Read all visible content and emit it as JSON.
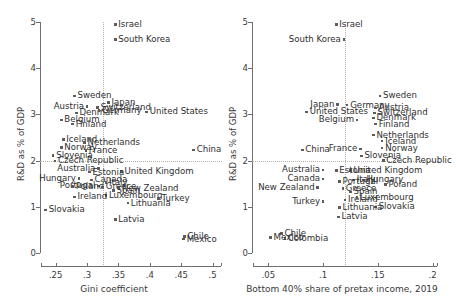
{
  "figure": {
    "type": "two-panel-scatter",
    "panels": 2,
    "marker_color": "#5d5d5d",
    "axis_color": "#6f6f6f",
    "refline_color": "#b9b0a8"
  },
  "chart_data": [
    {
      "type": "scatter",
      "panel": "left",
      "title": "",
      "xlabel": "Gini coefficient",
      "ylabel": "R&D as % of GDP",
      "xlim": [
        0.225,
        0.515
      ],
      "ylim": [
        0,
        5
      ],
      "xticks": [
        ".25",
        ".3",
        ".35",
        ".4",
        ".45",
        ".5"
      ],
      "xtick_values": [
        0.25,
        0.3,
        0.35,
        0.4,
        0.45,
        0.5
      ],
      "yticks": [
        "0",
        "1",
        "2",
        "3",
        "4",
        "5"
      ],
      "ytick_values": [
        0,
        1,
        2,
        3,
        4,
        5
      ],
      "grid": false,
      "legend": "none",
      "reference_lines": {
        "vertical_x": 0.325,
        "horizontal_y": 2.0,
        "style": "dotted"
      },
      "points": [
        {
          "label": "Israel",
          "x": 0.345,
          "y": 4.95,
          "lpos": "right"
        },
        {
          "label": "South Korea",
          "x": 0.345,
          "y": 4.62,
          "lpos": "right"
        },
        {
          "label": "Sweden",
          "x": 0.28,
          "y": 3.4,
          "lpos": "right"
        },
        {
          "label": "Japan",
          "x": 0.334,
          "y": 3.26,
          "lpos": "right"
        },
        {
          "label": "Austria",
          "x": 0.3,
          "y": 3.17,
          "lpos": "left"
        },
        {
          "label": "Switzerland",
          "x": 0.317,
          "y": 3.15,
          "lpos": "right"
        },
        {
          "label": "Denmark",
          "x": 0.283,
          "y": 3.03,
          "lpos": "right"
        },
        {
          "label": "Germany",
          "x": 0.319,
          "y": 3.08,
          "lpos": "right"
        },
        {
          "label": "United States",
          "x": 0.395,
          "y": 3.05,
          "lpos": "right"
        },
        {
          "label": "Belgium",
          "x": 0.259,
          "y": 2.88,
          "lpos": "right"
        },
        {
          "label": "Finland",
          "x": 0.277,
          "y": 2.79,
          "lpos": "right"
        },
        {
          "label": "Iceland",
          "x": 0.262,
          "y": 2.46,
          "lpos": "right"
        },
        {
          "label": "Netherlands",
          "x": 0.296,
          "y": 2.39,
          "lpos": "right"
        },
        {
          "label": "Norway",
          "x": 0.259,
          "y": 2.28,
          "lpos": "right"
        },
        {
          "label": "France",
          "x": 0.298,
          "y": 2.22,
          "lpos": "right"
        },
        {
          "label": "China",
          "x": 0.47,
          "y": 2.23,
          "lpos": "right"
        },
        {
          "label": "Slovenia",
          "x": 0.246,
          "y": 2.11,
          "lpos": "right"
        },
        {
          "label": "Czech Republic",
          "x": 0.249,
          "y": 1.99,
          "lpos": "right"
        },
        {
          "label": "Australia",
          "x": 0.318,
          "y": 1.83,
          "lpos": "left"
        },
        {
          "label": "United Kingdom",
          "x": 0.355,
          "y": 1.76,
          "lpos": "right"
        },
        {
          "label": "Estonia",
          "x": 0.304,
          "y": 1.75,
          "lpos": "right"
        },
        {
          "label": "Hungary",
          "x": 0.287,
          "y": 1.61,
          "lpos": "left"
        },
        {
          "label": "Canada",
          "x": 0.307,
          "y": 1.58,
          "lpos": "right"
        },
        {
          "label": "Italy",
          "x": 0.33,
          "y": 1.53,
          "lpos": "right"
        },
        {
          "label": "Portugal",
          "x": 0.318,
          "y": 1.45,
          "lpos": "left"
        },
        {
          "label": "Poland",
          "x": 0.277,
          "y": 1.44,
          "lpos": "right"
        },
        {
          "label": "Greece",
          "x": 0.325,
          "y": 1.43,
          "lpos": "right"
        },
        {
          "label": "New Zealand",
          "x": 0.351,
          "y": 1.4,
          "lpos": "right"
        },
        {
          "label": "Spain",
          "x": 0.342,
          "y": 1.35,
          "lpos": "right"
        },
        {
          "label": "Luxembourg",
          "x": 0.33,
          "y": 1.25,
          "lpos": "right"
        },
        {
          "label": "Ireland",
          "x": 0.28,
          "y": 1.21,
          "lpos": "right"
        },
        {
          "label": "Turkey",
          "x": 0.414,
          "y": 1.18,
          "lpos": "right"
        },
        {
          "label": "Lithuania",
          "x": 0.365,
          "y": 1.08,
          "lpos": "right"
        },
        {
          "label": "Slovakia",
          "x": 0.234,
          "y": 0.93,
          "lpos": "right"
        },
        {
          "label": "Latvia",
          "x": 0.345,
          "y": 0.73,
          "lpos": "right"
        },
        {
          "label": "Chile",
          "x": 0.455,
          "y": 0.36,
          "lpos": "right"
        },
        {
          "label": "Mexico",
          "x": 0.454,
          "y": 0.3,
          "lpos": "right"
        }
      ]
    },
    {
      "type": "scatter",
      "panel": "right",
      "title": "",
      "xlabel": "Bottom 40% share of pretax income, 2019",
      "ylabel": "R&D as % of GDP",
      "xlim": [
        0.035,
        0.205
      ],
      "ylim": [
        0,
        5
      ],
      "xticks": [
        ".05",
        ".1",
        ".15",
        ".2"
      ],
      "xtick_values": [
        0.05,
        0.1,
        0.15,
        0.2
      ],
      "yticks": [
        "0",
        "1",
        "2",
        "3",
        "4",
        "5"
      ],
      "ytick_values": [
        0,
        1,
        2,
        3,
        4,
        5
      ],
      "grid": false,
      "legend": "none",
      "reference_lines": {
        "vertical_x": 0.12,
        "horizontal_y": 2.0,
        "style": "dotted"
      },
      "points": [
        {
          "label": "Israel",
          "x": 0.112,
          "y": 4.95,
          "lpos": "right"
        },
        {
          "label": "South Korea",
          "x": 0.119,
          "y": 4.62,
          "lpos": "left"
        },
        {
          "label": "Sweden",
          "x": 0.152,
          "y": 3.4,
          "lpos": "right"
        },
        {
          "label": "Japan",
          "x": 0.113,
          "y": 3.22,
          "lpos": "left"
        },
        {
          "label": "Germany",
          "x": 0.122,
          "y": 3.2,
          "lpos": "right"
        },
        {
          "label": "Austria",
          "x": 0.148,
          "y": 3.14,
          "lpos": "right"
        },
        {
          "label": "United States",
          "x": 0.085,
          "y": 3.05,
          "lpos": "right"
        },
        {
          "label": "Switzerland",
          "x": 0.147,
          "y": 3.03,
          "lpos": "right"
        },
        {
          "label": "Denmark",
          "x": 0.146,
          "y": 2.92,
          "lpos": "right"
        },
        {
          "label": "Belgium",
          "x": 0.131,
          "y": 2.88,
          "lpos": "left"
        },
        {
          "label": "Finland",
          "x": 0.148,
          "y": 2.79,
          "lpos": "right"
        },
        {
          "label": "Netherlands",
          "x": 0.146,
          "y": 2.55,
          "lpos": "right"
        },
        {
          "label": "Iceland",
          "x": 0.154,
          "y": 2.42,
          "lpos": "right"
        },
        {
          "label": "France",
          "x": 0.134,
          "y": 2.25,
          "lpos": "left"
        },
        {
          "label": "Norway",
          "x": 0.154,
          "y": 2.27,
          "lpos": "right"
        },
        {
          "label": "China",
          "x": 0.081,
          "y": 2.23,
          "lpos": "right"
        },
        {
          "label": "Slovenia",
          "x": 0.135,
          "y": 2.1,
          "lpos": "right"
        },
        {
          "label": "Czech Republic",
          "x": 0.155,
          "y": 2.0,
          "lpos": "right"
        },
        {
          "label": "United Kingdom",
          "x": 0.125,
          "y": 1.78,
          "lpos": "right"
        },
        {
          "label": "Australia",
          "x": 0.1,
          "y": 1.8,
          "lpos": "left"
        },
        {
          "label": "Estonia",
          "x": 0.112,
          "y": 1.78,
          "lpos": "right"
        },
        {
          "label": "Italy",
          "x": 0.128,
          "y": 1.58,
          "lpos": "right"
        },
        {
          "label": "Hungary",
          "x": 0.137,
          "y": 1.58,
          "lpos": "right"
        },
        {
          "label": "Canada",
          "x": 0.1,
          "y": 1.6,
          "lpos": "left"
        },
        {
          "label": "Portugal",
          "x": 0.115,
          "y": 1.55,
          "lpos": "right"
        },
        {
          "label": "Poland",
          "x": 0.157,
          "y": 1.48,
          "lpos": "right"
        },
        {
          "label": "New Zealand",
          "x": 0.095,
          "y": 1.42,
          "lpos": "left"
        },
        {
          "label": "Greece",
          "x": 0.118,
          "y": 1.4,
          "lpos": "right"
        },
        {
          "label": "Spain",
          "x": 0.125,
          "y": 1.32,
          "lpos": "right"
        },
        {
          "label": "Ireland",
          "x": 0.12,
          "y": 1.15,
          "lpos": "right"
        },
        {
          "label": "Luxembourg",
          "x": 0.131,
          "y": 1.2,
          "lpos": "right"
        },
        {
          "label": "Turkey",
          "x": 0.1,
          "y": 1.12,
          "lpos": "left"
        },
        {
          "label": "Slovakia",
          "x": 0.148,
          "y": 1.0,
          "lpos": "right"
        },
        {
          "label": "Lithuania",
          "x": 0.115,
          "y": 0.98,
          "lpos": "right"
        },
        {
          "label": "Latvia",
          "x": 0.114,
          "y": 0.78,
          "lpos": "right"
        },
        {
          "label": "Chile",
          "x": 0.062,
          "y": 0.42,
          "lpos": "right"
        },
        {
          "label": "Colombia",
          "x": 0.065,
          "y": 0.32,
          "lpos": "right"
        },
        {
          "label": "Mexico",
          "x": 0.052,
          "y": 0.33,
          "lpos": "right"
        }
      ]
    }
  ]
}
